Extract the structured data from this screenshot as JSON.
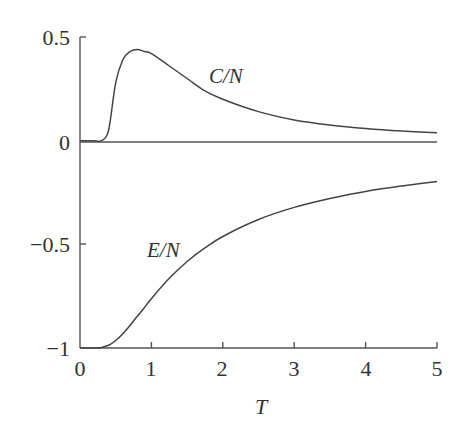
{
  "chart_data": {
    "type": "line",
    "title": "",
    "xlabel": "T",
    "ylabel": "",
    "xlim": [
      0,
      5
    ],
    "ylim": [
      -1,
      0.5
    ],
    "grid": false,
    "legend": "none (inline curve labels)",
    "x_ticks": [
      "0",
      "1",
      "2",
      "3",
      "4",
      "5"
    ],
    "y_ticks": [
      "0.5",
      "0",
      "−0.5",
      "−1"
    ],
    "x": [
      0.0,
      0.2,
      0.3,
      0.4,
      0.5,
      0.6,
      0.7,
      0.8,
      0.9,
      1.0,
      1.25,
      1.5,
      1.75,
      2.0,
      2.5,
      3.0,
      3.5,
      4.0,
      4.5,
      5.0
    ],
    "series": [
      {
        "name": "C/N",
        "values": [
          0.0,
          0.0,
          0.0,
          0.05,
          0.28,
          0.39,
          0.43,
          0.44,
          0.43,
          0.42,
          0.36,
          0.3,
          0.24,
          0.2,
          0.14,
          0.1,
          0.076,
          0.059,
          0.047,
          0.038
        ]
      },
      {
        "name": "E/N",
        "values": [
          -1.0,
          -1.0,
          -0.997,
          -0.987,
          -0.964,
          -0.931,
          -0.891,
          -0.848,
          -0.806,
          -0.762,
          -0.664,
          -0.583,
          -0.517,
          -0.462,
          -0.38,
          -0.322,
          -0.279,
          -0.245,
          -0.219,
          -0.197
        ]
      }
    ],
    "annotations": [
      {
        "text": "C/N",
        "x": 1.85,
        "y": 0.31
      },
      {
        "text": "E/N",
        "x": 1.1,
        "y": -0.51
      }
    ],
    "baseline": {
      "y": 0,
      "x_from": 0,
      "x_to": 5
    }
  },
  "labels": {
    "c_series": "C/N",
    "e_series": "E/N",
    "x_axis": "T",
    "y_ticks": [
      "0.5",
      "0",
      "−0.5",
      "−1"
    ],
    "x_ticks": [
      "0",
      "1",
      "2",
      "3",
      "4",
      "5"
    ]
  }
}
